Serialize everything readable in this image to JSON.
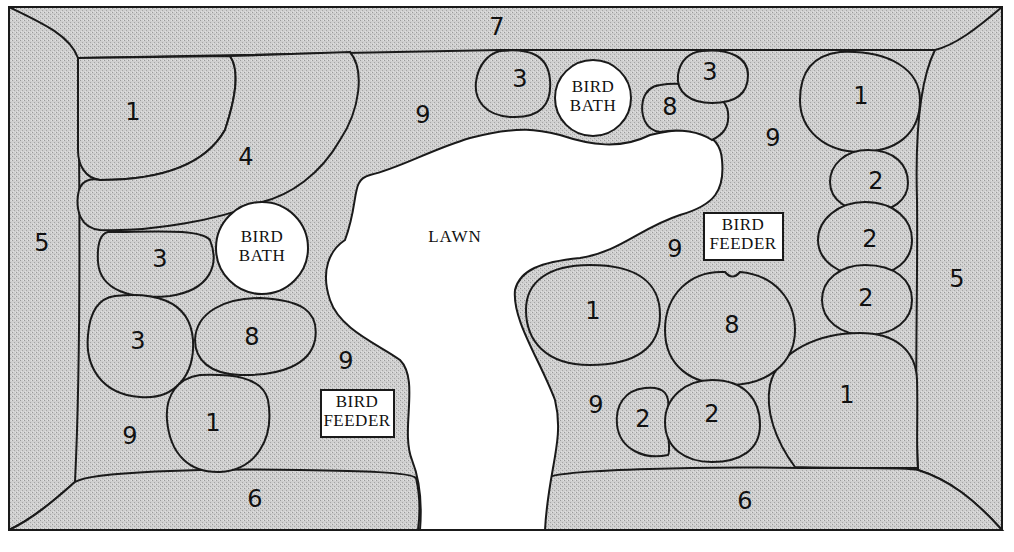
{
  "diagram": {
    "type": "garden-plan",
    "colors": {
      "bed_fill": "#c8c8c8",
      "outline": "#1a1a1a",
      "lawn_fill": "#ffffff"
    },
    "lawn": {
      "label": "LAWN"
    },
    "borders": {
      "top": "7",
      "left": "5",
      "right": "5",
      "bottom_left": "6",
      "bottom_right": "6"
    },
    "features": {
      "bird_bath_top": {
        "line1": "BIRD",
        "line2": "BATH"
      },
      "bird_bath_left": {
        "line1": "BIRD",
        "line2": "BATH"
      },
      "bird_feeder_left": {
        "line1": "BIRD",
        "line2": "FEEDER"
      },
      "bird_feeder_right": {
        "line1": "BIRD",
        "line2": "FEEDER"
      }
    },
    "plant_labels": {
      "left_top_1": "1",
      "left_4": "4",
      "left_3a": "3",
      "left_3b": "3",
      "left_8": "8",
      "left_1b": "1",
      "left_9a": "9",
      "left_9b": "9",
      "top_9": "9",
      "top_3a": "3",
      "top_3b": "3",
      "top_8": "8",
      "right_9a": "9",
      "right_1a": "1",
      "right_2a": "2",
      "right_2b": "2",
      "right_2c": "2",
      "right_9b": "9",
      "mid_1": "1",
      "mid_8": "8",
      "mid_9": "9",
      "mid_2a": "2",
      "mid_2b": "2",
      "right_1b": "1"
    }
  }
}
